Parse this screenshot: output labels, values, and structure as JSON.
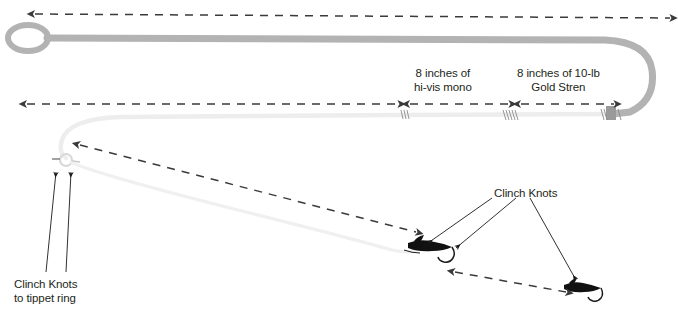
{
  "diagram": {
    "colors": {
      "fly_line": "#b3b3b3",
      "leader": "#e8e8e8",
      "tippet": "#f0f0f0",
      "dash_arrow": "#3a3a3a",
      "text": "#231f20",
      "fly": "#1a1a1a",
      "background": "#ffffff"
    },
    "labels": {
      "hi_vis_mono": {
        "line1": "8 inches of",
        "line2": "hi-vis mono"
      },
      "gold_stren": {
        "line1": "8 inches of 10-lb",
        "line2": "Gold Stren"
      },
      "clinch_knots_right": {
        "line1": "Clinch Knots"
      },
      "clinch_knots_left": {
        "line1": "Clinch Knots",
        "line2": "to tippet ring"
      }
    },
    "components": {
      "welded_loop": "welded-loop",
      "fly_line_segment": "fly-line",
      "leader_segment": "leader-line",
      "tippet_ring": "tippet-ring",
      "blood_knot_1": "blood-knot",
      "blood_knot_2": "blood-knot",
      "blood_knot_3": "blood-knot",
      "fly_upper": "artificial-fly",
      "fly_lower": "artificial-fly"
    },
    "measure_arrows": {
      "fly_line_span": "double-headed-dashed-arrow",
      "leader_span": "double-headed-dashed-arrow",
      "hi_vis_span": "double-headed-dashed-arrow",
      "gold_stren_span": "double-headed-dashed-arrow",
      "tippet_span": "double-headed-dashed-arrow",
      "dropper_span": "double-headed-dashed-arrow"
    }
  }
}
